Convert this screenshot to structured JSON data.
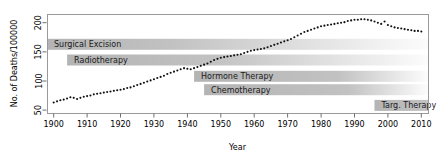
{
  "chart_data": {
    "type": "scatter",
    "title": "",
    "xlabel": "Year",
    "ylabel": "No. of Deaths/100000",
    "xlim": [
      1898,
      2012
    ],
    "ylim": [
      45,
      215
    ],
    "grid": false,
    "legend": "none",
    "xticks": [
      1900,
      1910,
      1920,
      1930,
      1940,
      1950,
      1960,
      1970,
      1980,
      1990,
      2000,
      2010
    ],
    "yticks": [
      50,
      100,
      150,
      200
    ],
    "series": [
      {
        "name": "Cancer deaths per 100000",
        "marker": "dotted-line",
        "color": "#111111",
        "x": [
          1900,
          1901,
          1902,
          1903,
          1904,
          1905,
          1906,
          1907,
          1908,
          1909,
          1910,
          1911,
          1912,
          1913,
          1914,
          1915,
          1916,
          1917,
          1918,
          1919,
          1920,
          1921,
          1922,
          1923,
          1924,
          1925,
          1926,
          1927,
          1928,
          1929,
          1930,
          1931,
          1932,
          1933,
          1934,
          1935,
          1936,
          1937,
          1938,
          1939,
          1940,
          1941,
          1942,
          1943,
          1944,
          1945,
          1946,
          1947,
          1948,
          1949,
          1950,
          1951,
          1952,
          1953,
          1954,
          1955,
          1956,
          1957,
          1958,
          1959,
          1960,
          1961,
          1962,
          1963,
          1964,
          1965,
          1966,
          1967,
          1968,
          1969,
          1970,
          1971,
          1972,
          1973,
          1974,
          1975,
          1976,
          1977,
          1978,
          1979,
          1980,
          1981,
          1982,
          1983,
          1984,
          1985,
          1986,
          1987,
          1988,
          1989,
          1990,
          1991,
          1992,
          1993,
          1994,
          1995,
          1996,
          1997,
          1998,
          1999,
          2000,
          2001,
          2002,
          2003,
          2004,
          2005,
          2006,
          2007,
          2008,
          2009,
          2010
        ],
        "y": [
          63,
          65,
          67,
          68,
          70,
          72,
          71,
          69,
          71,
          73,
          74,
          75,
          77,
          78,
          79,
          80,
          81,
          82,
          83,
          84,
          85,
          86,
          88,
          89,
          91,
          93,
          95,
          97,
          99,
          101,
          103,
          105,
          107,
          109,
          112,
          114,
          116,
          118,
          120,
          122,
          121,
          120,
          122,
          124,
          126,
          128,
          130,
          133,
          136,
          138,
          140,
          141,
          142,
          143,
          144,
          145,
          146,
          148,
          150,
          152,
          153,
          154,
          155,
          156,
          158,
          160,
          162,
          164,
          166,
          168,
          170,
          172,
          175,
          178,
          181,
          184,
          186,
          188,
          190,
          192,
          194,
          195,
          196,
          197,
          198,
          199,
          200,
          201,
          203,
          204,
          205,
          205,
          206,
          206,
          205,
          204,
          202,
          200,
          198,
          202,
          196,
          194,
          192,
          191,
          190,
          189,
          188,
          187,
          186,
          186,
          185
        ]
      }
    ],
    "era_bars": [
      {
        "label": "Surgical Excision",
        "start_year": 1898,
        "fade_end_year": 2012,
        "solid_end_year": 1935,
        "value_level": 163,
        "color": "#b4b4b4"
      },
      {
        "label": "Radiotherapy",
        "start_year": 1904,
        "fade_end_year": 2012,
        "solid_end_year": 1948,
        "value_level": 136,
        "color": "#b4b4b4"
      },
      {
        "label": "Hormone Therapy",
        "start_year": 1942,
        "fade_end_year": 2012,
        "solid_end_year": 1985,
        "value_level": 108,
        "color": "#b4b4b4"
      },
      {
        "label": "Chemotherapy",
        "start_year": 1945,
        "fade_end_year": 2012,
        "solid_end_year": 1988,
        "value_level": 85,
        "color": "#b4b4b4"
      },
      {
        "label": "Targ. Therapy",
        "start_year": 1996,
        "fade_end_year": 2012,
        "solid_end_year": 2012,
        "value_level": 58,
        "color": "#b4b4b4"
      }
    ]
  }
}
